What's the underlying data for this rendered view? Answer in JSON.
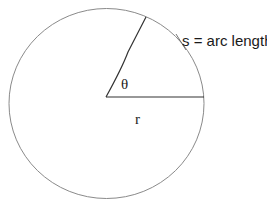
{
  "diagram": {
    "circle": {
      "cx": 106.5,
      "cy": 103.5,
      "rx": 97.5,
      "ry": 95,
      "stroke": "#8a8a8a"
    },
    "center": {
      "x": 106,
      "y": 97
    },
    "radius_line": {
      "x2": 204,
      "y2": 97,
      "stroke": "#333333"
    },
    "angle_line": {
      "x2": 146,
      "y2": 17,
      "stroke": "#333333"
    },
    "labels": {
      "arc": "s = arc length",
      "theta": "θ",
      "radius": "r"
    }
  }
}
